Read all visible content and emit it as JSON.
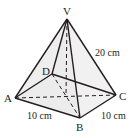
{
  "figure": {
    "type": "square-based pyramid",
    "vertices": {
      "V": {
        "label": "V",
        "x": 67,
        "y": 19
      },
      "A": {
        "label": "A",
        "x": 15,
        "y": 98
      },
      "B": {
        "label": "B",
        "x": 80,
        "y": 118
      },
      "C": {
        "label": "C",
        "x": 116,
        "y": 95
      },
      "D": {
        "label": "D",
        "x": 52,
        "y": 74
      },
      "O": {
        "label": "",
        "x": 66,
        "y": 96
      }
    },
    "measurements": {
      "slant_edge": "20 cm",
      "base_edge_ab": "10 cm",
      "base_edge_bc": "10 cm"
    },
    "colors": {
      "line": "#231f20",
      "face_fill": "#e6e6e6",
      "background": "#ffffff"
    }
  }
}
